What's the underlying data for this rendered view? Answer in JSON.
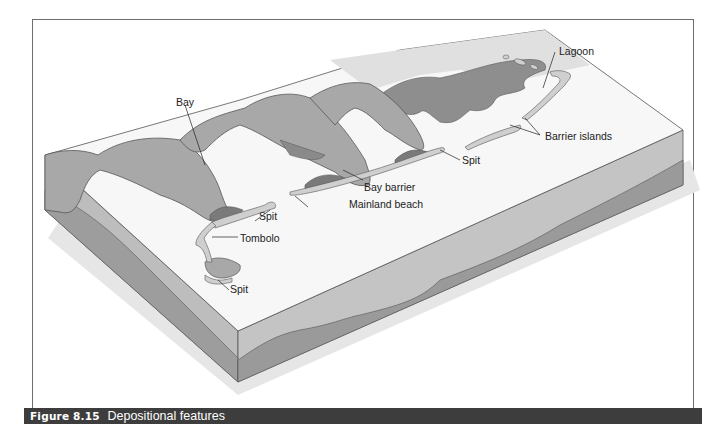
{
  "figure": {
    "number": "Figure 8.15",
    "title": "Depositional features"
  },
  "labels": {
    "lagoon": "Lagoon",
    "barrier_islands": "Barrier islands",
    "spit_right": "Spit",
    "bay": "Bay",
    "bay_barrier": "Bay barrier",
    "mainland_beach": "Mainland beach",
    "spit_middle": "Spit",
    "tombolo": "Tombolo",
    "spit_lower": "Spit"
  },
  "colors": {
    "land": "#a8a8a8",
    "land_dark": "#8a8a8a",
    "sea": "#f7f7f7",
    "beach": "#cfcfcf",
    "front_face_upper": "#c4c4c4",
    "front_face_lower": "#9a9a9a",
    "caption_bar": "#3d3d3d"
  }
}
